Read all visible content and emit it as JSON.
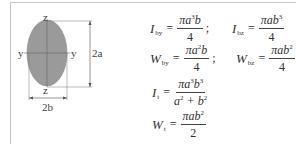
{
  "figure": {
    "shape": "ellipse",
    "fill_color": "#9a9a9a",
    "axis_labels": {
      "y_left": "y",
      "y_right": "y",
      "z_top": "z",
      "z_bottom": "z"
    },
    "dimensions": {
      "height": "2a",
      "width": "2b"
    }
  },
  "formulas": {
    "I_by": {
      "symbol": "I",
      "sub": "by",
      "num_pre": "πa",
      "num_exp1": "3",
      "num_post": "b",
      "den": "4",
      "sep": ";"
    },
    "I_bz": {
      "symbol": "I",
      "sub": "bz",
      "num_pre": "πab",
      "num_exp1": "3",
      "den": "4"
    },
    "W_by": {
      "symbol": "W",
      "sub": "by",
      "num_pre": "πa",
      "num_exp1": "2",
      "num_post": "b",
      "den": "4",
      "sep": ";"
    },
    "W_bz": {
      "symbol": "W",
      "sub": "bz",
      "num_pre": "πab",
      "num_exp1": "2",
      "den": "4"
    },
    "I_t": {
      "symbol": "I",
      "sub": "t",
      "num_pre": "πa",
      "num_exp1": "3",
      "num_mid": "b",
      "num_exp2": "3",
      "den_a": "a",
      "den_exp1": "2",
      "den_plus": " + b",
      "den_exp2": "2"
    },
    "W_t": {
      "symbol": "W",
      "sub": "t",
      "num_pre": "πab",
      "num_exp1": "2",
      "den": "2"
    },
    "equals": "="
  }
}
